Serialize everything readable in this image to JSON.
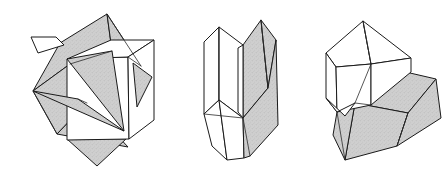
{
  "figure": {
    "background_color": "#ffffff",
    "line_color": "#1a1a1a",
    "shaded_face_color": "#c9c9c9",
    "light_face_color": "#ffffff",
    "width": 448,
    "height": 172
  },
  "diagrams": [
    {
      "id": "left",
      "name": "interpenetrant-cube-octahedron-twin",
      "label": "",
      "shaded_faces": 6,
      "light_faces": 5
    },
    {
      "id": "middle",
      "name": "contact-twin-prismatic-crystal",
      "label": "",
      "shaded_faces": 3,
      "light_faces": 6
    },
    {
      "id": "right",
      "name": "interpenetrant-twin-blocky-crystal",
      "label": "",
      "shaded_faces": 4,
      "light_faces": 6
    }
  ]
}
